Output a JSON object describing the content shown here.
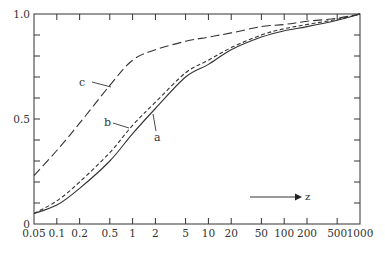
{
  "chart_data": {
    "type": "line",
    "title": "",
    "xlabel": "z",
    "ylabel": "",
    "xscale": "log",
    "xlim": [
      0.05,
      1000
    ],
    "ylim": [
      0,
      1.0
    ],
    "grid": false,
    "legend": "inline labels",
    "x_ticks": [
      0.05,
      0.1,
      0.2,
      0.5,
      1,
      2,
      5,
      10,
      20,
      50,
      100,
      200,
      500,
      1000
    ],
    "x_tick_labels": [
      "0.05",
      "0.1",
      "0.2",
      "0.5",
      "1",
      "2",
      "5",
      "10",
      "20",
      "50",
      "100",
      "200",
      "500",
      "1000"
    ],
    "y_tick_labels": [
      {
        "value": 0,
        "label": "0"
      },
      {
        "value": 0.5,
        "label": "0.5"
      },
      {
        "value": 1.0,
        "label": "1.0"
      }
    ],
    "y_minor_ticks": [
      0.1,
      0.2,
      0.3,
      0.4,
      0.5,
      0.6,
      0.7,
      0.8,
      0.9
    ],
    "arrow_annotation": {
      "label": "z",
      "direction": "right"
    },
    "x": [
      0.05,
      0.1,
      0.2,
      0.5,
      1,
      2,
      5,
      10,
      20,
      50,
      100,
      200,
      500,
      1000
    ],
    "series": [
      {
        "name": "a",
        "style": "solid",
        "values": [
          0.05,
          0.09,
          0.17,
          0.3,
          0.43,
          0.55,
          0.7,
          0.76,
          0.83,
          0.89,
          0.92,
          0.94,
          0.97,
          1.0
        ]
      },
      {
        "name": "b",
        "style": "short-dash",
        "values": [
          0.05,
          0.11,
          0.2,
          0.34,
          0.47,
          0.58,
          0.72,
          0.78,
          0.84,
          0.9,
          0.93,
          0.95,
          0.975,
          1.0
        ]
      },
      {
        "name": "c",
        "style": "long-dash",
        "values": [
          0.23,
          0.35,
          0.48,
          0.66,
          0.78,
          0.83,
          0.87,
          0.89,
          0.91,
          0.94,
          0.95,
          0.965,
          0.98,
          1.0
        ]
      }
    ]
  },
  "labels": {
    "a": "a",
    "b": "b",
    "c": "c",
    "z": "z"
  }
}
